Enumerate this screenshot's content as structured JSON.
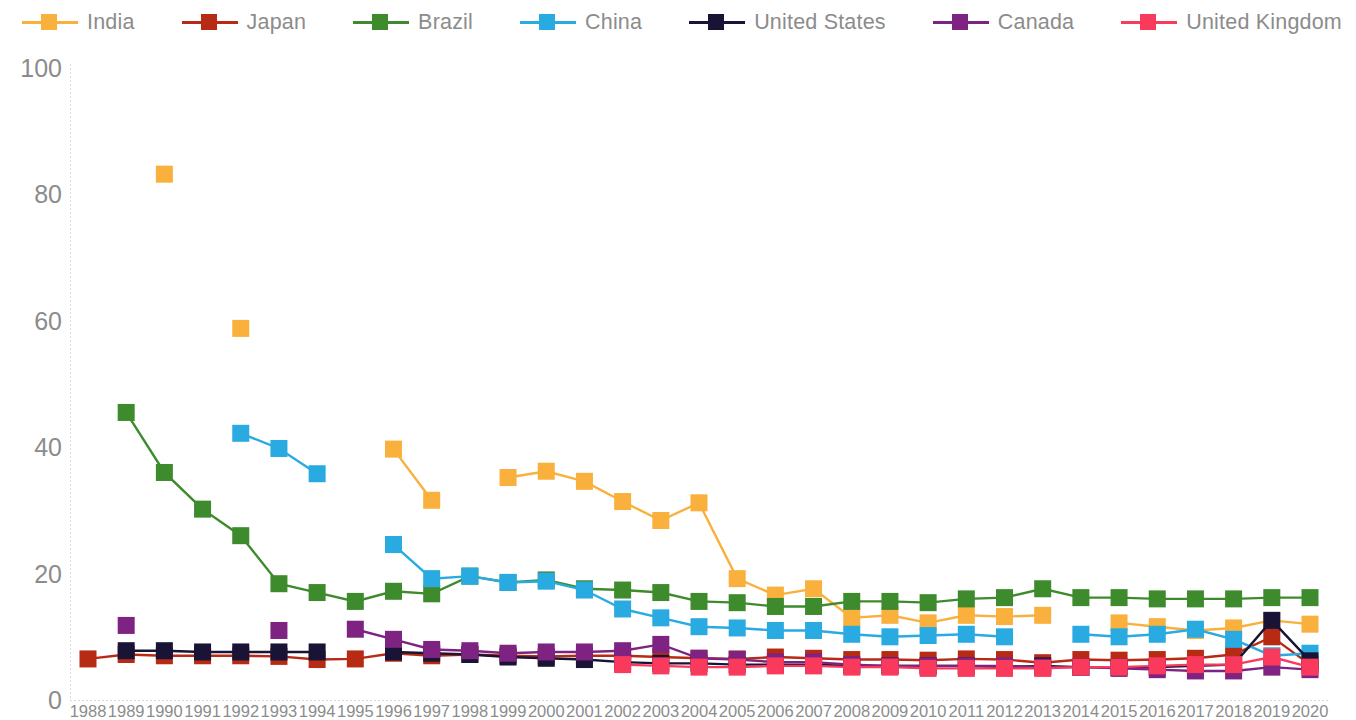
{
  "legend": {
    "items": [
      {
        "label": "India",
        "color": "#f9b03c"
      },
      {
        "label": "Japan",
        "color": "#b72a13"
      },
      {
        "label": "Brazil",
        "color": "#3d8b2c"
      },
      {
        "label": "China",
        "color": "#29abe2"
      },
      {
        "label": "United States",
        "color": "#191335"
      },
      {
        "label": "Canada",
        "color": "#7e2382"
      },
      {
        "label": "United Kingdom",
        "color": "#fa3a5c"
      }
    ]
  },
  "chart_data": {
    "type": "line",
    "title": "",
    "xlabel": "",
    "ylabel": "",
    "ylim": [
      0,
      100
    ],
    "yticks": [
      0,
      20,
      40,
      60,
      80,
      100
    ],
    "grid": false,
    "legend_position": "top",
    "marker": "square",
    "x": [
      1988,
      1989,
      1990,
      1991,
      1992,
      1993,
      1994,
      1995,
      1996,
      1997,
      1998,
      1999,
      2000,
      2001,
      2002,
      2003,
      2004,
      2005,
      2006,
      2007,
      2008,
      2009,
      2010,
      2011,
      2012,
      2013,
      2014,
      2015,
      2016,
      2017,
      2018,
      2019,
      2020
    ],
    "categories": [
      "1988",
      "1989",
      "1990",
      "1991",
      "1992",
      "1993",
      "1994",
      "1995",
      "1996",
      "1997",
      "1998",
      "1999",
      "2000",
      "2001",
      "2002",
      "2003",
      "2004",
      "2005",
      "2006",
      "2007",
      "2008",
      "2009",
      "2010",
      "2011",
      "2012",
      "2013",
      "2014",
      "2015",
      "2016",
      "2017",
      "2018",
      "2019",
      "2020"
    ],
    "series": [
      {
        "name": "India",
        "color": "#f9b03c",
        "values": [
          null,
          null,
          83.2,
          null,
          58.8,
          null,
          null,
          null,
          39.7,
          31.6,
          null,
          35.2,
          36.2,
          34.6,
          31.4,
          28.4,
          31.2,
          19.2,
          16.6,
          17.6,
          13.0,
          13.4,
          12.2,
          13.4,
          13.2,
          13.4,
          null,
          12.2,
          11.6,
          11.0,
          11.4,
          12.6,
          12.0
        ]
      },
      {
        "name": "Japan",
        "color": "#b72a13",
        "values": [
          6.5,
          7.2,
          7.0,
          7.0,
          7.0,
          6.9,
          6.4,
          6.5,
          7.4,
          7.0,
          7.2,
          7.0,
          6.9,
          7.0,
          7.0,
          6.8,
          6.6,
          6.5,
          6.8,
          6.6,
          6.4,
          6.4,
          6.3,
          6.5,
          6.4,
          5.9,
          6.4,
          6.3,
          6.4,
          6.6,
          7.2,
          10.0,
          5.6
        ]
      },
      {
        "name": "Brazil",
        "color": "#3d8b2c",
        "values": [
          null,
          45.5,
          36.0,
          30.2,
          26.0,
          18.4,
          17.0,
          15.6,
          17.2,
          16.8,
          19.6,
          18.6,
          19.0,
          17.6,
          17.4,
          17.0,
          15.6,
          15.4,
          14.8,
          14.8,
          15.6,
          15.6,
          15.4,
          16.0,
          16.2,
          17.6,
          16.2,
          16.2,
          16.0,
          16.0,
          16.0,
          16.2,
          16.2
        ]
      },
      {
        "name": "China",
        "color": "#29abe2",
        "values": [
          null,
          null,
          null,
          null,
          42.2,
          39.8,
          35.8,
          null,
          24.6,
          19.2,
          19.6,
          18.6,
          18.8,
          17.4,
          14.4,
          13.0,
          11.6,
          11.4,
          11.0,
          11.0,
          10.4,
          10.0,
          10.2,
          10.4,
          10.0,
          null,
          10.4,
          10.0,
          10.4,
          11.2,
          9.6,
          7.0,
          7.4
        ]
      },
      {
        "name": "United States",
        "color": "#191335",
        "values": [
          null,
          7.8,
          7.8,
          7.6,
          7.6,
          7.6,
          7.6,
          null,
          7.6,
          7.4,
          7.2,
          6.8,
          6.6,
          6.4,
          6.0,
          5.8,
          5.8,
          5.6,
          5.6,
          5.6,
          5.4,
          5.4,
          5.4,
          5.4,
          5.2,
          5.4,
          5.2,
          5.2,
          5.2,
          5.4,
          5.6,
          12.6,
          6.2
        ]
      },
      {
        "name": "Canada",
        "color": "#7e2382",
        "values": [
          null,
          11.8,
          null,
          null,
          null,
          11.0,
          null,
          11.2,
          9.6,
          8.0,
          7.8,
          7.4,
          7.6,
          7.6,
          7.8,
          8.8,
          6.6,
          6.4,
          6.0,
          6.0,
          5.6,
          5.4,
          5.4,
          5.4,
          5.4,
          5.2,
          5.2,
          5.0,
          4.8,
          4.6,
          4.6,
          5.2,
          4.8
        ]
      },
      {
        "name": "United Kingdom",
        "color": "#fa3a5c",
        "values": [
          null,
          null,
          null,
          null,
          null,
          null,
          null,
          null,
          null,
          null,
          null,
          null,
          null,
          null,
          5.6,
          5.4,
          5.2,
          5.2,
          5.4,
          5.4,
          5.2,
          5.2,
          5.0,
          5.0,
          5.0,
          5.0,
          5.2,
          5.2,
          5.4,
          5.6,
          5.6,
          6.8,
          5.2
        ]
      }
    ]
  }
}
